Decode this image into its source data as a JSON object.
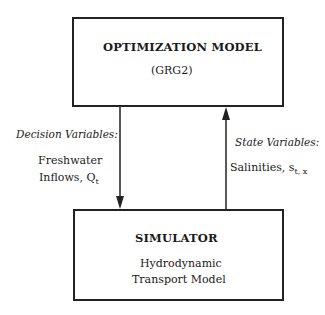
{
  "optimization_box": {
    "title": "OPTIMIZATION MODEL",
    "subtitle": "(GRG2)"
  },
  "simulator_box": {
    "title": "SIMULATOR",
    "line1": "Hydrodynamic",
    "line2": "Transport Model"
  },
  "down_arrow": {
    "label_heading": "Decision Variables:",
    "label_line1": "Freshwater",
    "label_line2": "Inflows, Q",
    "label_subscript": "t"
  },
  "up_arrow": {
    "label_heading": "State Variables:",
    "label_line1": "Salinities, s",
    "label_subscript": "t, x"
  }
}
